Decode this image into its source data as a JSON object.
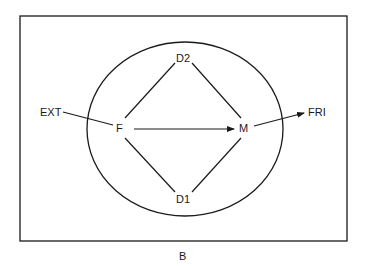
{
  "diagram": {
    "caption": "B",
    "nodes": {
      "ext": "EXT",
      "f": "F",
      "d2": "D2",
      "d1": "D1",
      "m": "M",
      "fri": "FRI"
    },
    "edges": [
      {
        "from": "EXT",
        "to": "F",
        "arrow": false
      },
      {
        "from": "F",
        "to": "D2",
        "arrow": false
      },
      {
        "from": "F",
        "to": "D1",
        "arrow": false
      },
      {
        "from": "D2",
        "to": "M",
        "arrow": false
      },
      {
        "from": "D1",
        "to": "M",
        "arrow": false
      },
      {
        "from": "F",
        "to": "M",
        "arrow": true
      },
      {
        "from": "M",
        "to": "FRI",
        "arrow": true
      }
    ],
    "colors": {
      "stroke": "#1a1a1a",
      "background": "#ffffff"
    }
  }
}
